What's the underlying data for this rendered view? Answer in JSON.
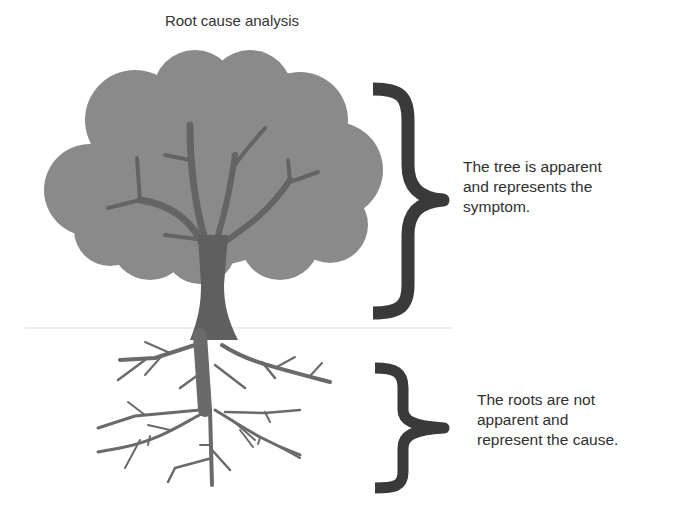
{
  "title": "Root cause analysis",
  "labels": {
    "tree": [
      "The tree is apparent",
      "and represents the",
      "symptom."
    ],
    "roots": [
      "The roots are not",
      "apparent and",
      "represent the cause."
    ]
  },
  "colors": {
    "canopy": "#8a8a8a",
    "trunk": "#5f5f5f",
    "roots": "#6a6a6a",
    "brace": "#3a3a3a",
    "ground_line": "#e4e4e4"
  }
}
